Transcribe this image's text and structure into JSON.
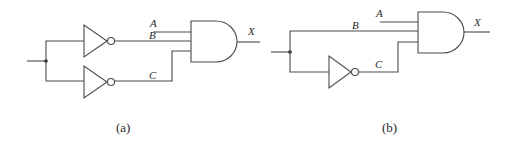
{
  "diagram": {
    "type": "logic-circuit",
    "panels": [
      {
        "id": "a",
        "caption": "(a)",
        "labels": {
          "A": "A",
          "B": "B",
          "C": "C",
          "X": "X"
        },
        "components": [
          "junction",
          "inverter-top",
          "inverter-bottom",
          "and-gate-3-input"
        ],
        "description": "Single input splits at junction into two inverters; inverted outputs B and C plus input A feed a 3-input AND gate producing X"
      },
      {
        "id": "b",
        "caption": "(b)",
        "labels": {
          "A": "A",
          "B": "B",
          "C": "C",
          "X": "X"
        },
        "components": [
          "junction",
          "inverter",
          "and-gate-3-input"
        ],
        "description": "Single input splits at junction; upper branch B goes directly to AND, lower branch passes through inverter as C; with input A feeds 3-input AND gate producing X"
      }
    ]
  },
  "colors": {
    "line": "#4a4a4a",
    "text": "#2a2a2a",
    "background": "#ffffff"
  }
}
